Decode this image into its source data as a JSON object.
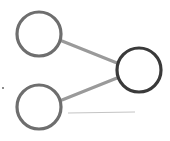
{
  "diagram": {
    "title": "",
    "colors": {
      "background": "#ffffff",
      "input_node_stroke": "#6e6e6e",
      "output_node_stroke": "#3a3a3a",
      "edge": "#9a9a9a",
      "faint_line": "#c4c4c4",
      "dot": "#555555"
    },
    "nodes": [
      {
        "id": "input-top",
        "cx": 39,
        "cy": 34,
        "r": 23
      },
      {
        "id": "input-bottom",
        "cx": 39,
        "cy": 107,
        "r": 23
      },
      {
        "id": "output",
        "cx": 139,
        "cy": 70,
        "r": 23
      }
    ],
    "edges": [
      {
        "from": "input-top",
        "to": "output"
      },
      {
        "from": "input-bottom",
        "to": "output"
      }
    ]
  }
}
